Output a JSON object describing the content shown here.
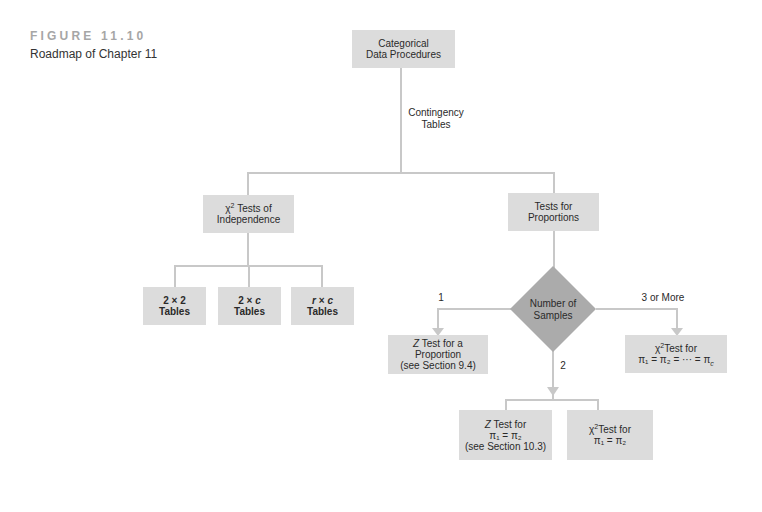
{
  "figure": {
    "label": "FIGURE 11.10",
    "caption": "Roadmap of Chapter 11"
  },
  "colors": {
    "box_fill": "#dcdcdc",
    "diamond_fill": "#ababab",
    "connector": "#c8c8c8",
    "figure_label": "#a6a6a6"
  },
  "nodes": {
    "root": {
      "line1": "Categorical",
      "line2": "Data Procedures"
    },
    "edge_root_label": {
      "line1": "Contingency",
      "line2": "Tables"
    },
    "independence": {
      "symbol": "χ",
      "sup": "2",
      "line1_rest": " Tests of",
      "line2": "Independence"
    },
    "table_2x2": {
      "line1": "2 × 2",
      "line2": "Tables"
    },
    "table_2xc": {
      "line1_a": "2 × ",
      "line1_var": "c",
      "line2": "Tables"
    },
    "table_rxc": {
      "line1_var1": "r",
      "line1_op": " × ",
      "line1_var2": "c",
      "line2": "Tables"
    },
    "proportions": {
      "line1": "Tests for",
      "line2": "Proportions"
    },
    "decision": {
      "line1": "Number of",
      "line2": "Samples"
    },
    "branch_labels": {
      "one": "1",
      "two": "2",
      "three_or_more": "3 or More"
    },
    "z_one": {
      "var": "Z",
      "line1_rest": " Test for a",
      "line2": "Proportion",
      "line3": "(see Section 9.4)"
    },
    "chi_many": {
      "symbol": "χ",
      "sup": "2",
      "line1_rest": "Test for",
      "line2": "π₁ = π₂ = ··· = π",
      "line2_sub": "c"
    },
    "z_two": {
      "var": "Z",
      "line1_rest": " Test for",
      "line2": "π₁ = π₂",
      "line3": "(see Section 10.3)"
    },
    "chi_two": {
      "symbol": "χ",
      "sup": "2",
      "line1_rest": "Test for",
      "line2": "π₁ = π₂"
    }
  }
}
